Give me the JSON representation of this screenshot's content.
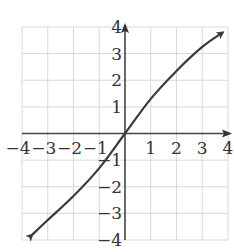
{
  "chart_data": {
    "type": "line",
    "title": "",
    "xlabel": "",
    "ylabel": "",
    "xlim": [
      -4,
      4
    ],
    "ylim": [
      -4,
      4
    ],
    "grid": true,
    "legend": null,
    "x_ticks": [
      "-4",
      "-3",
      "-2",
      "-1",
      "1",
      "2",
      "3",
      "4"
    ],
    "y_ticks": [
      "4",
      "3",
      "2",
      "1",
      "-1",
      "-2",
      "-3",
      "-4"
    ],
    "series": [
      {
        "name": "curve",
        "arrows_both_ends": true,
        "x": [
          -3.6,
          -3,
          -2,
          -1,
          0,
          1,
          2,
          3,
          3.8
        ],
        "y": [
          -3.8,
          -3.25,
          -2.35,
          -1.3,
          0,
          1.3,
          2.35,
          3.25,
          3.8
        ]
      }
    ]
  },
  "colors": {
    "grid": "#d9d9d9",
    "axis": "#444444",
    "curve": "#3a3a3a",
    "text": "#333333"
  }
}
